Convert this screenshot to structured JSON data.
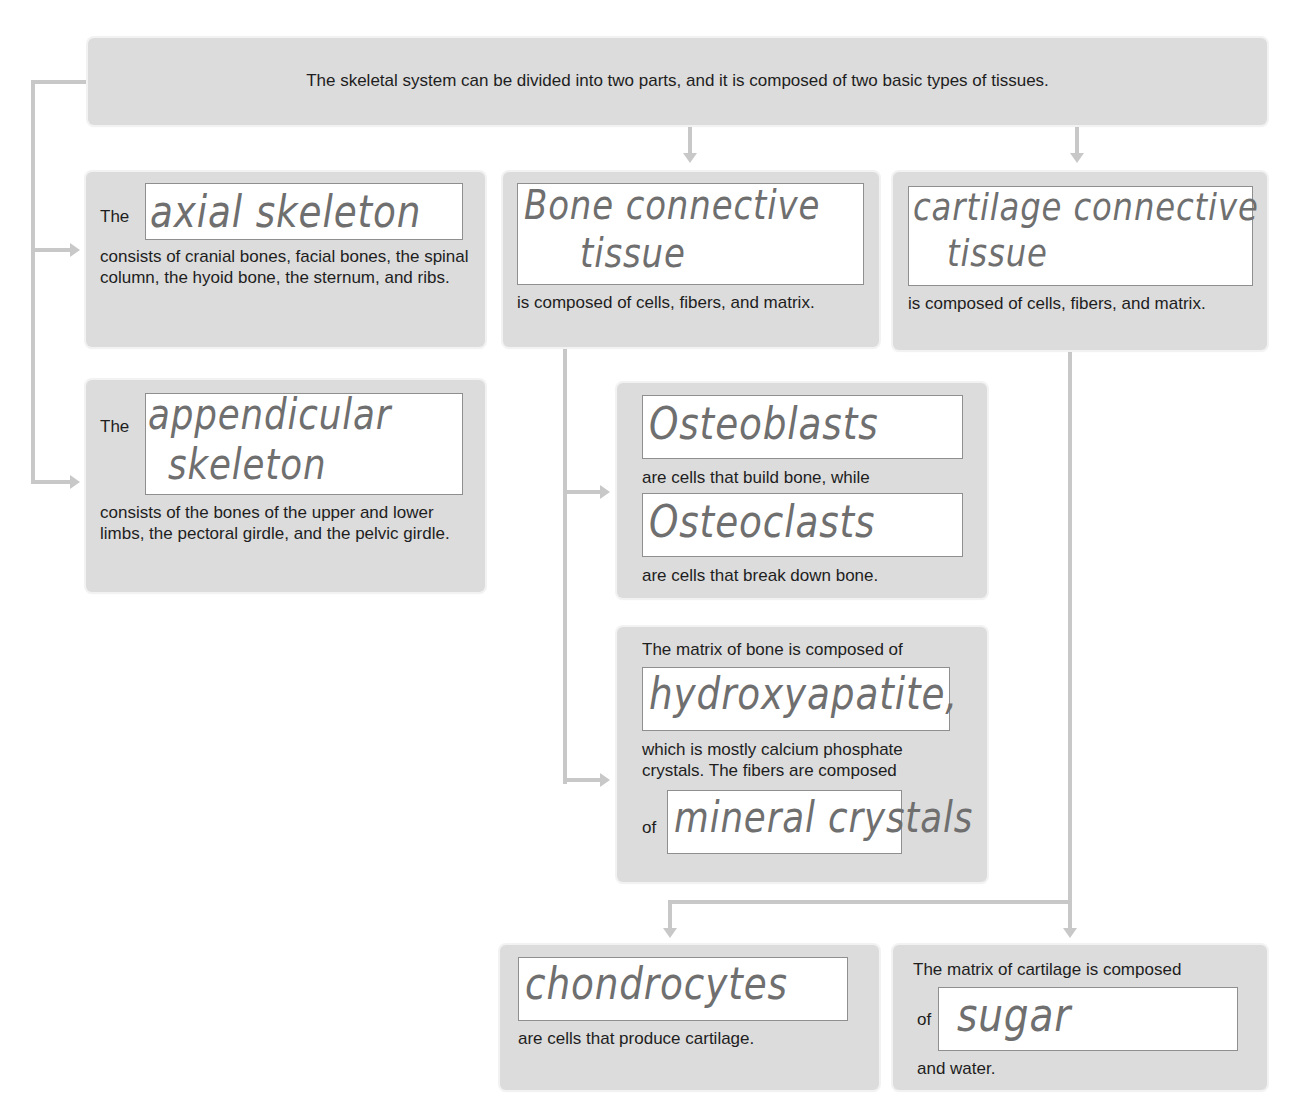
{
  "diagram": {
    "title": "The skeletal system can be divided into two parts, and it is composed of two basic types of tissues.",
    "colors": {
      "box_fill": "#dcdcdc",
      "connector": "#c8c8c8",
      "blank_fill": "#ffffff",
      "handwriting": "#6f6f6f"
    },
    "axial": {
      "prefix": "The",
      "answer": "axial skeleton",
      "text": "consists of cranial bones, facial bones, the spinal column, the hyoid bone, the sternum, and ribs."
    },
    "appendicular": {
      "prefix": "The",
      "answer_line1": "appendicular",
      "answer_line2": "skeleton",
      "text": "consists of the bones of the upper and lower limbs, the pectoral girdle, and the pelvic girdle."
    },
    "bone_tissue": {
      "answer_line1": "Bone connective",
      "answer_line2": "tissue",
      "text": "is composed of cells, fibers, and matrix."
    },
    "cartilage_tissue": {
      "answer_line1": "cartilage connective",
      "answer_line2": "tissue",
      "text": "is composed of cells, fibers, and matrix."
    },
    "bone_cells": {
      "answer1": "Osteoblasts",
      "text1": "are cells that build bone, while",
      "answer2": "Osteoclasts",
      "text2": "are cells that break down bone."
    },
    "bone_matrix": {
      "text1": "The matrix of bone is composed of",
      "answer1": "hydroxyapatite,",
      "text2": "which is mostly calcium phosphate crystals. The fibers are composed",
      "prefix2": "of",
      "answer2": "mineral crystals"
    },
    "cartilage_cells": {
      "answer": "chondrocytes",
      "text": "are cells that produce cartilage."
    },
    "cartilage_matrix": {
      "text1": "The matrix of cartilage is composed",
      "prefix": "of",
      "answer": "sugar",
      "text2": "and water."
    }
  }
}
